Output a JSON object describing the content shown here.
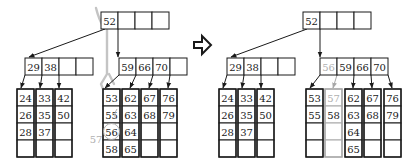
{
  "diagram": {
    "transition_arrow": "hollow-right-arrow-icon",
    "colors": {
      "ink": "#1a1a1a",
      "highlight": "#c4c4c4",
      "new_key": "#b0b0b0"
    },
    "before": {
      "root": {
        "keys": [
          "52",
          "",
          "",
          ""
        ]
      },
      "internal": [
        {
          "keys": [
            "29",
            "38",
            "",
            ""
          ]
        },
        {
          "keys": [
            "59",
            "66",
            "70",
            ""
          ]
        }
      ],
      "leaves_left": [
        [
          "24",
          "26",
          "28",
          ""
        ],
        [
          "33",
          "35",
          "37",
          ""
        ],
        [
          "42",
          "50",
          "",
          ""
        ]
      ],
      "leaves_right": [
        [
          "53",
          "55",
          "56",
          "58"
        ],
        [
          "62",
          "63",
          "64",
          "65"
        ],
        [
          "67",
          "68",
          "",
          ""
        ],
        [
          "76",
          "79",
          "",
          ""
        ]
      ],
      "inserted_key": "57",
      "circled_key": "56"
    },
    "after": {
      "root": {
        "keys": [
          "52",
          "",
          "",
          ""
        ]
      },
      "internal": [
        {
          "keys": [
            "29",
            "38",
            "",
            ""
          ],
          "new_flags": [
            false,
            false,
            false,
            false
          ]
        },
        {
          "keys": [
            "56",
            "59",
            "66",
            "70"
          ],
          "new_flags": [
            true,
            false,
            false,
            false
          ]
        }
      ],
      "leaves_left": [
        [
          "24",
          "26",
          "28",
          ""
        ],
        [
          "33",
          "35",
          "37",
          ""
        ],
        [
          "42",
          "50",
          "",
          ""
        ]
      ],
      "leaves_right": [
        {
          "keys": [
            "53",
            "55",
            "",
            ""
          ],
          "new_flags": [
            false,
            false,
            false,
            false
          ],
          "is_new": false
        },
        {
          "keys": [
            "57",
            "58",
            "",
            ""
          ],
          "new_flags": [
            true,
            false,
            false,
            false
          ],
          "is_new": true
        },
        {
          "keys": [
            "62",
            "63",
            "64",
            "65"
          ],
          "new_flags": [
            false,
            false,
            false,
            false
          ],
          "is_new": false
        },
        {
          "keys": [
            "67",
            "68",
            "",
            ""
          ],
          "new_flags": [
            false,
            false,
            false,
            false
          ],
          "is_new": false
        },
        {
          "keys": [
            "76",
            "79",
            "",
            ""
          ],
          "new_flags": [
            false,
            false,
            false,
            false
          ],
          "is_new": false
        }
      ]
    }
  }
}
